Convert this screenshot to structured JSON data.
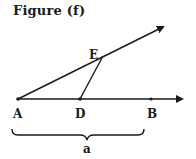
{
  "title": "Figure (f)",
  "labels": {
    "A": "A",
    "D": "D",
    "B": "B",
    "E": "E",
    "brace": "a"
  },
  "geometry": {
    "points": {
      "A": [
        18,
        99
      ],
      "D": [
        80,
        99
      ],
      "B": [
        151,
        99
      ],
      "E": [
        103,
        56
      ]
    },
    "ray_AB_end": [
      187,
      99
    ],
    "ray_AE_end": [
      167,
      25
    ],
    "brace_span": [
      12,
      144
    ]
  },
  "colors": {
    "ink": "#1a1a1a",
    "background": "#ffffff"
  }
}
